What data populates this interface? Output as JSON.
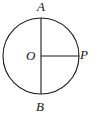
{
  "figure": {
    "kind": "geometry-diagram",
    "canvas": {
      "width": 97,
      "height": 116,
      "background": "#ffffff"
    },
    "stroke_color": "#1a1a1a",
    "stroke_width": 1,
    "circle": {
      "name": "circle-O",
      "cx": 41,
      "cy": 56,
      "r": 38
    },
    "segments": [
      {
        "name": "diameter-AB",
        "x1": 41,
        "y1": 18,
        "x2": 41,
        "y2": 94
      },
      {
        "name": "radius-OP",
        "x1": 41,
        "y1": 56,
        "x2": 79,
        "y2": 56
      }
    ],
    "labels": [
      {
        "id": "A",
        "text": "A",
        "role": "top-endpoint-of-diameter"
      },
      {
        "id": "P",
        "text": "P",
        "role": "point-on-circle-right"
      },
      {
        "id": "O",
        "text": "O",
        "role": "center-of-circle"
      },
      {
        "id": "B",
        "text": "B",
        "role": "bottom-endpoint-of-diameter"
      }
    ]
  }
}
